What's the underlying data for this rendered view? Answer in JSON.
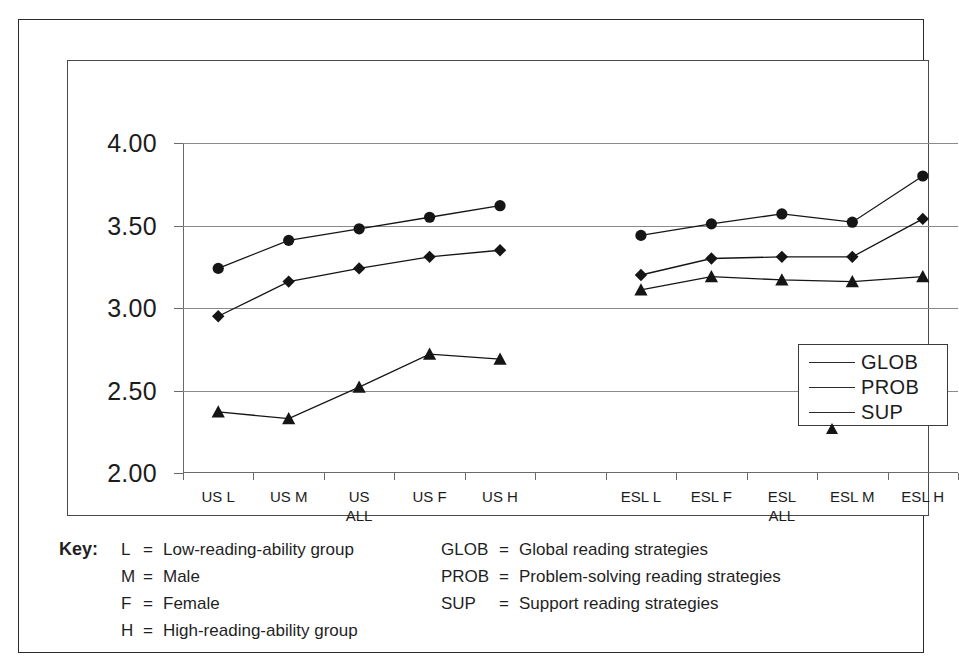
{
  "chart_data": {
    "type": "line",
    "title": "",
    "xlabel": "",
    "ylabel": "",
    "ylim": [
      2.0,
      4.0
    ],
    "ytick_labels": [
      "4.00",
      "3.50",
      "3.00",
      "2.50",
      "2.00"
    ],
    "ytick_values": [
      4.0,
      3.5,
      3.0,
      2.5,
      2.0
    ],
    "grid": "horizontal",
    "legend_position": "inside-right",
    "categories": [
      "US L",
      "US M",
      "US\nALL",
      "US F",
      "US H",
      "",
      "ESL L",
      "ESL F",
      "ESL\nALL",
      "ESL M",
      "ESL H"
    ],
    "category_labels": [
      {
        "line1": "US L",
        "line2": ""
      },
      {
        "line1": "US M",
        "line2": ""
      },
      {
        "line1": "US",
        "line2": "ALL"
      },
      {
        "line1": "US F",
        "line2": ""
      },
      {
        "line1": "US H",
        "line2": ""
      },
      {
        "line1": "ESL L",
        "line2": ""
      },
      {
        "line1": "ESL F",
        "line2": ""
      },
      {
        "line1": "ESL",
        "line2": "ALL"
      },
      {
        "line1": "ESL M",
        "line2": ""
      },
      {
        "line1": "ESL H",
        "line2": ""
      }
    ],
    "series": [
      {
        "name": "GLOB",
        "marker": "diamond",
        "color": "#151515",
        "segments": [
          {
            "x": [
              "US L",
              "US M",
              "US ALL",
              "US F",
              "US H"
            ],
            "values": [
              2.95,
              3.16,
              3.24,
              3.31,
              3.35
            ]
          },
          {
            "x": [
              "ESL L",
              "ESL F",
              "ESL ALL",
              "ESL M",
              "ESL H"
            ],
            "values": [
              3.2,
              3.3,
              3.31,
              3.31,
              3.54
            ]
          }
        ]
      },
      {
        "name": "PROB",
        "marker": "circle",
        "color": "#151515",
        "segments": [
          {
            "x": [
              "US L",
              "US M",
              "US ALL",
              "US F",
              "US H"
            ],
            "values": [
              3.24,
              3.41,
              3.48,
              3.55,
              3.62
            ]
          },
          {
            "x": [
              "ESL L",
              "ESL F",
              "ESL ALL",
              "ESL M",
              "ESL H"
            ],
            "values": [
              3.44,
              3.51,
              3.57,
              3.52,
              3.8
            ]
          }
        ]
      },
      {
        "name": "SUP",
        "marker": "triangle",
        "color": "#151515",
        "segments": [
          {
            "x": [
              "US L",
              "US M",
              "US ALL",
              "US F",
              "US H"
            ],
            "values": [
              2.37,
              2.33,
              2.52,
              2.72,
              2.69
            ]
          },
          {
            "x": [
              "ESL L",
              "ESL F",
              "ESL ALL",
              "ESL M",
              "ESL H"
            ],
            "values": [
              3.11,
              3.19,
              3.17,
              3.16,
              3.19
            ]
          }
        ]
      }
    ]
  },
  "legend": {
    "entries": [
      {
        "label": "GLOB",
        "marker": "diamond"
      },
      {
        "label": "PROB",
        "marker": "circle"
      },
      {
        "label": "SUP",
        "marker": "triangle"
      }
    ]
  },
  "key": {
    "title": "Key:",
    "left": [
      {
        "symbol": "L",
        "eq": "=",
        "definition": "Low-reading-ability group"
      },
      {
        "symbol": "M",
        "eq": "=",
        "definition": "Male"
      },
      {
        "symbol": "F",
        "eq": "=",
        "definition": "Female"
      },
      {
        "symbol": "H",
        "eq": "=",
        "definition": "High-reading-ability group"
      }
    ],
    "right": [
      {
        "symbol": "GLOB",
        "eq": "=",
        "definition": "Global reading strategies"
      },
      {
        "symbol": "PROB",
        "eq": "=",
        "definition": "Problem-solving reading strategies"
      },
      {
        "symbol": "SUP",
        "eq": "=",
        "definition": "Support reading strategies"
      }
    ]
  }
}
